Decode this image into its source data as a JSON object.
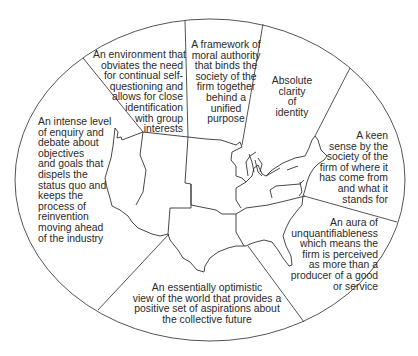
{
  "diagram": {
    "type": "segmented-ellipse-over-us-map",
    "colors": {
      "line": "#555555",
      "text": "#2a2a2a",
      "background": "#ffffff"
    },
    "segments": [
      {
        "id": "environment",
        "text": "An environment that\nobviates the need\nfor continual self-\nquestioning and\nallows for close\nidentification\nwith group\ninterests"
      },
      {
        "id": "framework",
        "text": "A framework of\nmoral authority\nthat binds the\nsociety of the\nfirm together\nbehind a\nunified\npurpose"
      },
      {
        "id": "clarity",
        "text": "Absolute\nclarity\nof\nidentity"
      },
      {
        "id": "sense",
        "text": "A keen\nsense by the\nsociety of the\nfirm of where it\nhas come from\nand what it\nstands for"
      },
      {
        "id": "aura",
        "text": "An aura of\nunquantifiableness\nwhich means the\nfirm is perceived\nas more than a\nproducer of a good\nor service"
      },
      {
        "id": "optimistic",
        "text": "An essentially optimistic\nview of the world that provides a\npositive set of aspirations about\nthe collective future"
      },
      {
        "id": "enquiry",
        "text": "An intense level\nof enquiry and\ndebate about\nobjectives\nand goals that\ndispels the\nstatus quo and\nkeeps the\nprocess of\nreinvention\nmoving ahead\nof the industry"
      }
    ]
  }
}
